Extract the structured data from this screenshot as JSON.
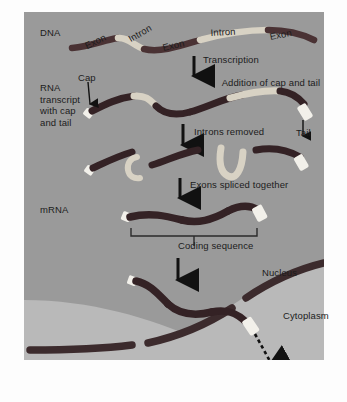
{
  "diagram": {
    "title_row_labels": {
      "dna": "DNA",
      "rna_transcript": "RNA\ntranscript\nwith cap\nand tail",
      "mrna": "mRNA"
    },
    "dna_segments": [
      {
        "type": "exon",
        "label": "Exon"
      },
      {
        "type": "intron",
        "label": "Intron"
      },
      {
        "type": "exon",
        "label": "Exon"
      },
      {
        "type": "intron",
        "label": "Intron"
      },
      {
        "type": "exon",
        "label": "Exon"
      }
    ],
    "annotations": {
      "cap": "Cap",
      "tail": "Tail",
      "coding_sequence": "Coding sequence",
      "nucleus": "Nucleus",
      "cytoplasm": "Cytoplasm"
    },
    "process_steps": [
      {
        "line1": "Transcription",
        "line2": "Addition of cap and tail"
      },
      {
        "line1": "Introns removed",
        "line2": ""
      },
      {
        "line1": "Exons spliced together",
        "line2": ""
      }
    ],
    "colors": {
      "panel_background": "#9a9a9a",
      "nucleus_fill": "#8e8e8e",
      "cytoplasm_fill": "#b9b9b9",
      "exon_strand": "#4a3234",
      "intron_light": "#d8d2c4",
      "cap_tail_white": "#f2f0ea",
      "membrane": "#3c2b2d",
      "text": "#1c1c1c",
      "page_background": "#fdfdfd"
    }
  }
}
